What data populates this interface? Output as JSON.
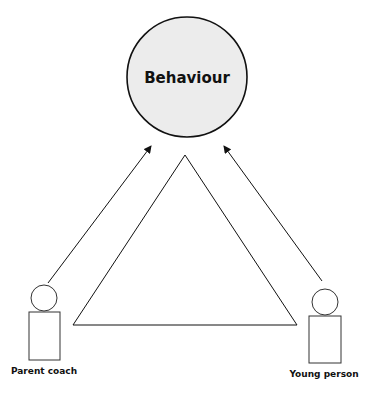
{
  "diagram": {
    "center_node": {
      "label": "Behaviour",
      "fill": "#ececec"
    },
    "left_actor": {
      "label": "Parent coach"
    },
    "right_actor": {
      "label": "Young person"
    },
    "arrows": [
      {
        "from": "Parent coach",
        "to": "Behaviour"
      },
      {
        "from": "Young person",
        "to": "Behaviour"
      }
    ],
    "shapes": [
      "triangle"
    ]
  }
}
